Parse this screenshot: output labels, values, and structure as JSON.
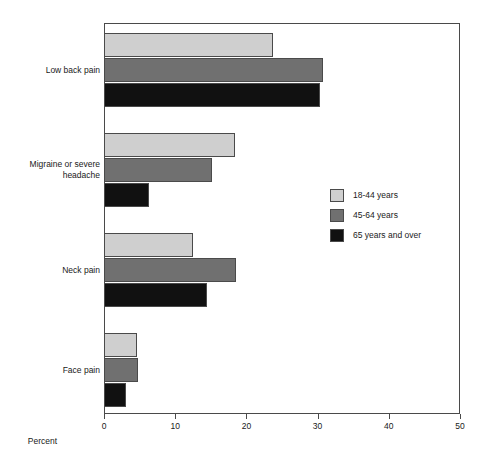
{
  "chart_data": {
    "type": "bar",
    "orientation": "horizontal",
    "title": "",
    "xlabel": "Percent",
    "ylabel": "",
    "xlim": [
      0,
      50
    ],
    "xticks": [
      0,
      10,
      20,
      30,
      40,
      50
    ],
    "xtick_labels": [
      "0",
      "10",
      "20",
      "30",
      "40",
      "50"
    ],
    "grid": false,
    "legend_position": "center-right",
    "categories": [
      "Low back pain",
      "Migraine or severe\nheadache",
      "Neck pain",
      "Face pain"
    ],
    "series": [
      {
        "name": "18-44 years",
        "color": "#cfcfcf",
        "values": [
          23.7,
          18.4,
          12.5,
          4.6
        ]
      },
      {
        "name": "45-64 years",
        "color": "#707070",
        "values": [
          30.7,
          15.1,
          18.5,
          4.8
        ]
      },
      {
        "name": "65 years and over",
        "color": "#111111",
        "values": [
          30.3,
          6.3,
          14.4,
          3.1
        ]
      }
    ]
  },
  "legend": {
    "items": [
      {
        "label": "18-44 years"
      },
      {
        "label": "45-64 years"
      },
      {
        "label": "65 years and over"
      }
    ]
  },
  "axis": {
    "x_title": "Percent"
  }
}
